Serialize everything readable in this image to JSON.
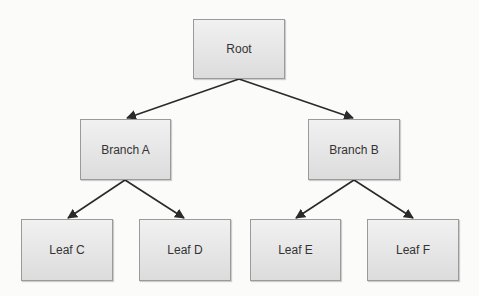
{
  "diagram": {
    "type": "tree",
    "nodes": [
      {
        "id": "root",
        "label": "Root",
        "x": 193,
        "y": 19,
        "w": 92,
        "h": 60
      },
      {
        "id": "branch_a",
        "label": "Branch A",
        "x": 80,
        "y": 119,
        "w": 91,
        "h": 61
      },
      {
        "id": "branch_b",
        "label": "Branch B",
        "x": 308,
        "y": 119,
        "w": 92,
        "h": 61
      },
      {
        "id": "leaf_c",
        "label": "Leaf C",
        "x": 21,
        "y": 219,
        "w": 92,
        "h": 62
      },
      {
        "id": "leaf_d",
        "label": "Leaf D",
        "x": 139,
        "y": 219,
        "w": 92,
        "h": 62
      },
      {
        "id": "leaf_e",
        "label": "Leaf E",
        "x": 250,
        "y": 219,
        "w": 91,
        "h": 62
      },
      {
        "id": "leaf_f",
        "label": "Leaf F",
        "x": 367,
        "y": 219,
        "w": 92,
        "h": 62
      }
    ],
    "edges": [
      {
        "from": "root",
        "to": "branch_a"
      },
      {
        "from": "root",
        "to": "branch_b"
      },
      {
        "from": "branch_a",
        "to": "leaf_c"
      },
      {
        "from": "branch_a",
        "to": "leaf_d"
      },
      {
        "from": "branch_b",
        "to": "leaf_e"
      },
      {
        "from": "branch_b",
        "to": "leaf_f"
      }
    ],
    "colors": {
      "node_border": "#9a9a9a",
      "node_fill_top": "#f1f1f1",
      "node_fill_bottom": "#dcdcdc",
      "edge": "#2a2a2a",
      "background": "#fbfbfa"
    }
  }
}
